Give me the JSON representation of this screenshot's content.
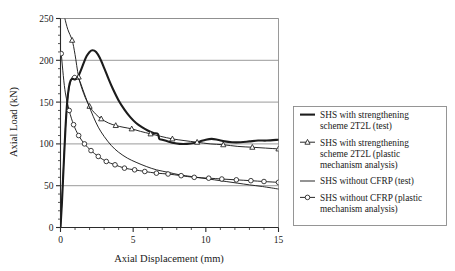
{
  "chart_data": {
    "type": "line",
    "title": "",
    "xlabel": "Axial Displacement (mm)",
    "ylabel": "Axial Load (kN)",
    "xlim": [
      0,
      15
    ],
    "ylim": [
      0,
      250
    ],
    "xticks": [
      0,
      5,
      10,
      15
    ],
    "xtick_labels": [
      "0",
      "5",
      "10",
      "15"
    ],
    "xtick_minor_step": 1,
    "yticks": [
      0,
      50,
      100,
      150,
      200,
      250
    ],
    "ytick_labels": [
      "0",
      "50",
      "100",
      "150",
      "200",
      "250"
    ],
    "ytick_minor_step": 10,
    "grid": "horizontal-major",
    "legend_position": "right-outside",
    "series": [
      {
        "name": "SHS with strengthening scheme 2T2L (test)",
        "style": "thick-line",
        "marker": "none",
        "points": [
          [
            0.0,
            0
          ],
          [
            0.1,
            30
          ],
          [
            0.22,
            75
          ],
          [
            0.34,
            118
          ],
          [
            0.46,
            150
          ],
          [
            0.58,
            168
          ],
          [
            0.7,
            176
          ],
          [
            0.84,
            178
          ],
          [
            1.0,
            177
          ],
          [
            1.2,
            180
          ],
          [
            1.4,
            188
          ],
          [
            1.6,
            197
          ],
          [
            1.8,
            205
          ],
          [
            2.0,
            210
          ],
          [
            2.2,
            212
          ],
          [
            2.45,
            210
          ],
          [
            2.7,
            203
          ],
          [
            3.0,
            191
          ],
          [
            3.3,
            178
          ],
          [
            3.6,
            166
          ],
          [
            4.0,
            152
          ],
          [
            4.4,
            141
          ],
          [
            4.8,
            132
          ],
          [
            5.2,
            125
          ],
          [
            5.6,
            120
          ],
          [
            6.0,
            116
          ],
          [
            6.4,
            113
          ],
          [
            6.7,
            112
          ],
          [
            6.8,
            106
          ],
          [
            7.0,
            105
          ],
          [
            7.4,
            103
          ],
          [
            7.8,
            101
          ],
          [
            8.2,
            100
          ],
          [
            8.7,
            100
          ],
          [
            9.2,
            101
          ],
          [
            9.6,
            103
          ],
          [
            10.0,
            105
          ],
          [
            10.4,
            106
          ],
          [
            10.8,
            105
          ],
          [
            11.3,
            103
          ],
          [
            11.8,
            102
          ],
          [
            12.4,
            102
          ],
          [
            13.0,
            103
          ],
          [
            13.6,
            104
          ],
          [
            14.2,
            104
          ],
          [
            15.0,
            105
          ]
        ]
      },
      {
        "name": "SHS with strengthening scheme 2T2L (plastic mechanism analysis)",
        "style": "thin-line",
        "marker": "triangle",
        "points": [
          [
            0.3,
            250
          ],
          [
            0.5,
            237
          ],
          [
            0.8,
            224
          ],
          [
            1.0,
            207
          ],
          [
            1.25,
            180
          ],
          [
            1.6,
            160
          ],
          [
            2.0,
            145
          ],
          [
            2.4,
            136
          ],
          [
            2.8,
            130
          ],
          [
            3.3,
            125
          ],
          [
            3.8,
            122
          ],
          [
            4.3,
            120
          ],
          [
            4.9,
            118
          ],
          [
            5.5,
            115
          ],
          [
            6.2,
            112
          ],
          [
            6.9,
            109
          ],
          [
            7.7,
            106
          ],
          [
            8.5,
            104
          ],
          [
            9.4,
            102
          ],
          [
            10.3,
            100
          ],
          [
            11.2,
            99
          ],
          [
            12.2,
            97
          ],
          [
            13.2,
            96
          ],
          [
            14.1,
            95
          ],
          [
            15.0,
            94
          ]
        ],
        "marker_points": [
          [
            0.8,
            224
          ],
          [
            1.25,
            180
          ],
          [
            2.0,
            145
          ],
          [
            2.8,
            130
          ],
          [
            3.8,
            122
          ],
          [
            4.9,
            118
          ],
          [
            6.2,
            112
          ],
          [
            7.7,
            106
          ],
          [
            9.4,
            102
          ],
          [
            11.2,
            99
          ],
          [
            13.2,
            96
          ],
          [
            15.0,
            94
          ]
        ]
      },
      {
        "name": "SHS without CFRP (test)",
        "style": "thin-line",
        "marker": "none",
        "points": [
          [
            0.0,
            0
          ],
          [
            0.12,
            40
          ],
          [
            0.26,
            92
          ],
          [
            0.4,
            135
          ],
          [
            0.55,
            162
          ],
          [
            0.7,
            175
          ],
          [
            0.85,
            181
          ],
          [
            1.0,
            182
          ],
          [
            1.15,
            180
          ],
          [
            1.35,
            174
          ],
          [
            1.6,
            162
          ],
          [
            1.9,
            148
          ],
          [
            2.25,
            133
          ],
          [
            2.6,
            120
          ],
          [
            3.0,
            109
          ],
          [
            3.5,
            98
          ],
          [
            4.0,
            90
          ],
          [
            4.6,
            83
          ],
          [
            5.2,
            78
          ],
          [
            5.9,
            73
          ],
          [
            6.6,
            69
          ],
          [
            7.4,
            66
          ],
          [
            8.2,
            63
          ],
          [
            9.0,
            61
          ],
          [
            9.8,
            59
          ],
          [
            10.6,
            57
          ],
          [
            11.4,
            55
          ],
          [
            12.2,
            53
          ],
          [
            13.0,
            51
          ],
          [
            13.9,
            49
          ],
          [
            15.0,
            46
          ]
        ]
      },
      {
        "name": "SHS without CFRP (plastic mechanism analysis)",
        "style": "thin-line",
        "marker": "circle",
        "points": [
          [
            0.05,
            208
          ],
          [
            0.3,
            165
          ],
          [
            0.6,
            140
          ],
          [
            0.9,
            123
          ],
          [
            1.25,
            110
          ],
          [
            1.65,
            100
          ],
          [
            2.1,
            92
          ],
          [
            2.6,
            85
          ],
          [
            3.15,
            79
          ],
          [
            3.75,
            75
          ],
          [
            4.4,
            71
          ],
          [
            5.1,
            69
          ],
          [
            5.8,
            67
          ],
          [
            6.6,
            65
          ],
          [
            7.4,
            64
          ],
          [
            8.3,
            62
          ],
          [
            9.2,
            60
          ],
          [
            10.2,
            59
          ],
          [
            11.1,
            58
          ],
          [
            12.1,
            57
          ],
          [
            13.1,
            56
          ],
          [
            14.0,
            55
          ],
          [
            15.0,
            54
          ]
        ],
        "marker_points": [
          [
            0.05,
            208
          ],
          [
            0.6,
            140
          ],
          [
            0.9,
            123
          ],
          [
            1.25,
            110
          ],
          [
            1.65,
            100
          ],
          [
            2.1,
            92
          ],
          [
            2.6,
            85
          ],
          [
            3.15,
            79
          ],
          [
            3.75,
            75
          ],
          [
            4.4,
            71
          ],
          [
            5.1,
            69
          ],
          [
            5.8,
            67
          ],
          [
            6.6,
            65
          ],
          [
            7.4,
            64
          ],
          [
            8.3,
            62
          ],
          [
            9.2,
            60
          ],
          [
            10.2,
            59
          ],
          [
            11.1,
            58
          ],
          [
            12.1,
            57
          ],
          [
            13.1,
            56
          ],
          [
            14.0,
            55
          ],
          [
            15.0,
            54
          ]
        ]
      }
    ]
  },
  "legend": {
    "entries": [
      {
        "marker": "line-thick",
        "lines": [
          "SHS with strengthening",
          "scheme 2T2L (test)"
        ]
      },
      {
        "marker": "triangle-line",
        "lines": [
          "SHS with strengthening",
          "scheme 2T2L (plastic",
          "mechanism analysis)"
        ]
      },
      {
        "marker": "line-thin",
        "lines": [
          "SHS without CFRP (test)"
        ]
      },
      {
        "marker": "circle-line",
        "lines": [
          "SHS without CFRP (plastic",
          "mechanism analysis)"
        ]
      }
    ]
  },
  "colors": {
    "background": "#ffffff",
    "axis": "#2b2b2b",
    "grid": "#8e8e8e",
    "series": "#1c1c1c",
    "legend_border": "#8a8a8a"
  }
}
